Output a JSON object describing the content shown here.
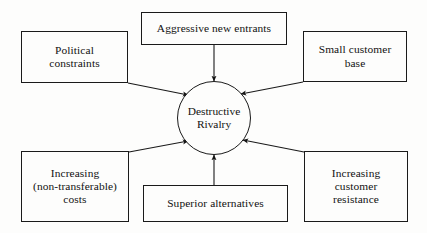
{
  "diagram": {
    "type": "hub-and-spoke-cause-diagram",
    "background_color": "#fdfdfc",
    "stroke_color": "#1a1a1a",
    "text_color": "#111111",
    "hub": {
      "label": "Destructive\nRivalry",
      "shape": "circle",
      "center_x": 214,
      "center_y": 118,
      "radius": 37
    },
    "nodes": [
      {
        "id": "political-constraints",
        "label": "Political\nconstraints",
        "x": 21,
        "y": 31,
        "width": 107,
        "height": 52
      },
      {
        "id": "aggressive-new-entrants",
        "label": "Aggressive new entrants",
        "x": 141,
        "y": 12,
        "width": 146,
        "height": 33
      },
      {
        "id": "small-customer-base",
        "label": "Small customer\nbase",
        "x": 303,
        "y": 31,
        "width": 104,
        "height": 51
      },
      {
        "id": "increasing-non-transferable-costs",
        "label": "Increasing\n(non-transferable)\ncosts",
        "x": 21,
        "y": 151,
        "width": 108,
        "height": 71
      },
      {
        "id": "superior-alternatives",
        "label": "Superior alternatives",
        "x": 143,
        "y": 185,
        "width": 145,
        "height": 37
      },
      {
        "id": "increasing-customer-resistance",
        "label": "Increasing\ncustomer\nresistance",
        "x": 304,
        "y": 151,
        "width": 104,
        "height": 71
      }
    ],
    "arrows": [
      {
        "id": "arrow-political-constraints-to-hub",
        "from": "political-constraints",
        "to": "hub",
        "x1": 128,
        "y1": 83,
        "x2": 188,
        "y2": 95,
        "direction": "down-right"
      },
      {
        "id": "arrow-aggressive-new-entrants-to-hub",
        "from": "aggressive-new-entrants",
        "to": "hub",
        "x1": 214,
        "y1": 45,
        "x2": 214,
        "y2": 81,
        "direction": "down"
      },
      {
        "id": "arrow-small-customer-base-to-hub",
        "from": "small-customer-base",
        "to": "hub",
        "x1": 303,
        "y1": 82,
        "x2": 241,
        "y2": 94,
        "direction": "down-left"
      },
      {
        "id": "arrow-increasing-costs-to-hub",
        "from": "increasing-non-transferable-costs",
        "to": "hub",
        "x1": 129,
        "y1": 152,
        "x2": 188,
        "y2": 141,
        "direction": "up-right"
      },
      {
        "id": "arrow-superior-alternatives-to-hub",
        "from": "superior-alternatives",
        "to": "hub",
        "x1": 214,
        "y1": 185,
        "x2": 214,
        "y2": 155,
        "direction": "up"
      },
      {
        "id": "arrow-increasing-customer-resistance-to-hub",
        "from": "increasing-customer-resistance",
        "to": "hub",
        "x1": 304,
        "y1": 152,
        "x2": 243,
        "y2": 140,
        "direction": "up-left"
      }
    ]
  }
}
